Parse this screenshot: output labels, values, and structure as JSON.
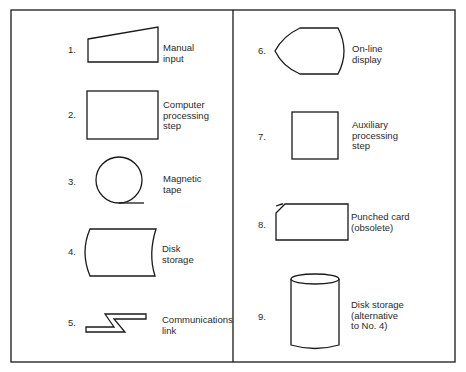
{
  "figure": {
    "colors": {
      "stroke": "#1a1a1a",
      "text": "#2a2a2a",
      "background": "#ffffff"
    },
    "symbols": [
      {
        "number": "1.",
        "label": "Manual\n input",
        "shape": "trapezoid-slanted-top"
      },
      {
        "number": "2.",
        "label": "Computer\nprocessing\nstep",
        "shape": "rectangle"
      },
      {
        "number": "3.",
        "label": "Magnetic\ntape",
        "shape": "circle-with-tail"
      },
      {
        "number": "4.",
        "label": "Disk\nstorage",
        "shape": "curved-sides-rectangle"
      },
      {
        "number": "5.",
        "label": "Communications\nlink",
        "shape": "lightning-zigzag"
      },
      {
        "number": "6.",
        "label": "On-line\ndisplay",
        "shape": "display"
      },
      {
        "number": "7.",
        "label": "Auxiliary\nprocessing\nstep",
        "shape": "square"
      },
      {
        "number": "8.",
        "label": "Punched card\n(obsolete)",
        "shape": "card-clipped-corner"
      },
      {
        "number": "9.",
        "label": "Disk storage\n(alternative\nto No. 4)",
        "shape": "cylinder"
      }
    ]
  }
}
